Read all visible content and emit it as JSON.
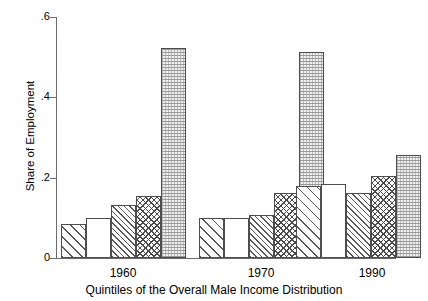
{
  "chart_data": {
    "type": "bar",
    "title": "",
    "xlabel": "Quintiles of the Overall Male Income Distribution",
    "ylabel": "Share of Employment",
    "ylim": [
      0,
      0.6
    ],
    "ytick_labels": [
      "0",
      ".2",
      ".4",
      ".6"
    ],
    "ytick_values": [
      0,
      0.2,
      0.4,
      0.6
    ],
    "grid": false,
    "legend": "none",
    "categories": [
      "1960",
      "1970",
      "1990"
    ],
    "series": [
      {
        "name": "Quintile 1",
        "pattern": "diagonal-hatch-wide",
        "values": [
          0.085,
          0.1,
          0.18
        ]
      },
      {
        "name": "Quintile 2",
        "pattern": "empty",
        "values": [
          0.1,
          0.1,
          0.184
        ]
      },
      {
        "name": "Quintile 3",
        "pattern": "diagonal-hatch-dense",
        "values": [
          0.132,
          0.108,
          0.163
        ]
      },
      {
        "name": "Quintile 4",
        "pattern": "crosshatch",
        "values": [
          0.155,
          0.162,
          0.205
        ]
      },
      {
        "name": "Quintile 5",
        "pattern": "stipple-dots",
        "values": [
          0.522,
          0.512,
          0.257
        ]
      }
    ]
  },
  "axes": {
    "y_title": "Share of Employment",
    "x_title": "Quintiles of the Overall Male Income Distribution",
    "y_ticks": [
      {
        "label": ".6",
        "value": 0.6
      },
      {
        "label": ".4",
        "value": 0.4
      },
      {
        "label": ".2",
        "value": 0.2
      },
      {
        "label": "0",
        "value": 0.0
      }
    ],
    "x_groups": [
      {
        "label": "1960"
      },
      {
        "label": "1970"
      },
      {
        "label": "1990"
      }
    ]
  },
  "colors": {
    "axis": "#6b6b6b",
    "bar_outline": "#4d4d4d",
    "hatch": "#5a5a5a",
    "background": "#ffffff"
  }
}
